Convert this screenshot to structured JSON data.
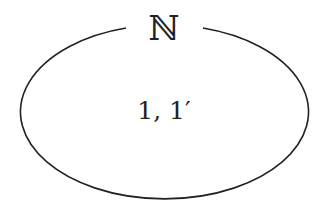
{
  "diagram": {
    "type": "set-ellipse",
    "set_name": "ℕ",
    "elements": "1, 1′",
    "stroke_color": "#222222",
    "background": "#ffffff"
  }
}
